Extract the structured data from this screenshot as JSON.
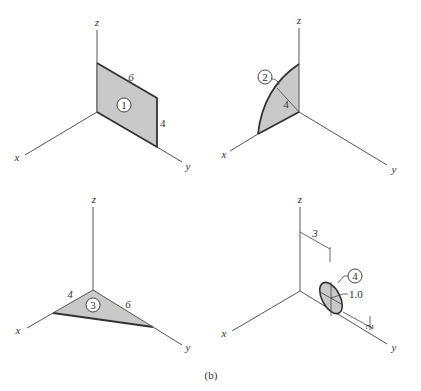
{
  "figure": {
    "caption": "(b)",
    "axis_labels": {
      "x": "x",
      "y": "y",
      "z": "z"
    },
    "panels": [
      {
        "id": 1,
        "shape": "rectangle in yz-plane",
        "tag": "1",
        "dimensions": {
          "top_edge": "6",
          "right_edge": "4"
        }
      },
      {
        "id": 2,
        "shape": "quarter circle in xz-plane",
        "tag": "2",
        "dimensions": {
          "radius": "4"
        }
      },
      {
        "id": 3,
        "shape": "triangle in xy-plane",
        "tag": "3",
        "dimensions": {
          "x_edge": "4",
          "y_edge": "6"
        }
      },
      {
        "id": 4,
        "shape": "circular disk parallel to yz-plane",
        "tag": "4",
        "dimensions": {
          "diameter": "1.0",
          "offset_y": "3",
          "offset_z": "2"
        }
      }
    ]
  },
  "colors": {
    "fill": "#c9c9c9",
    "line": "#333333",
    "axis": "#555555"
  }
}
